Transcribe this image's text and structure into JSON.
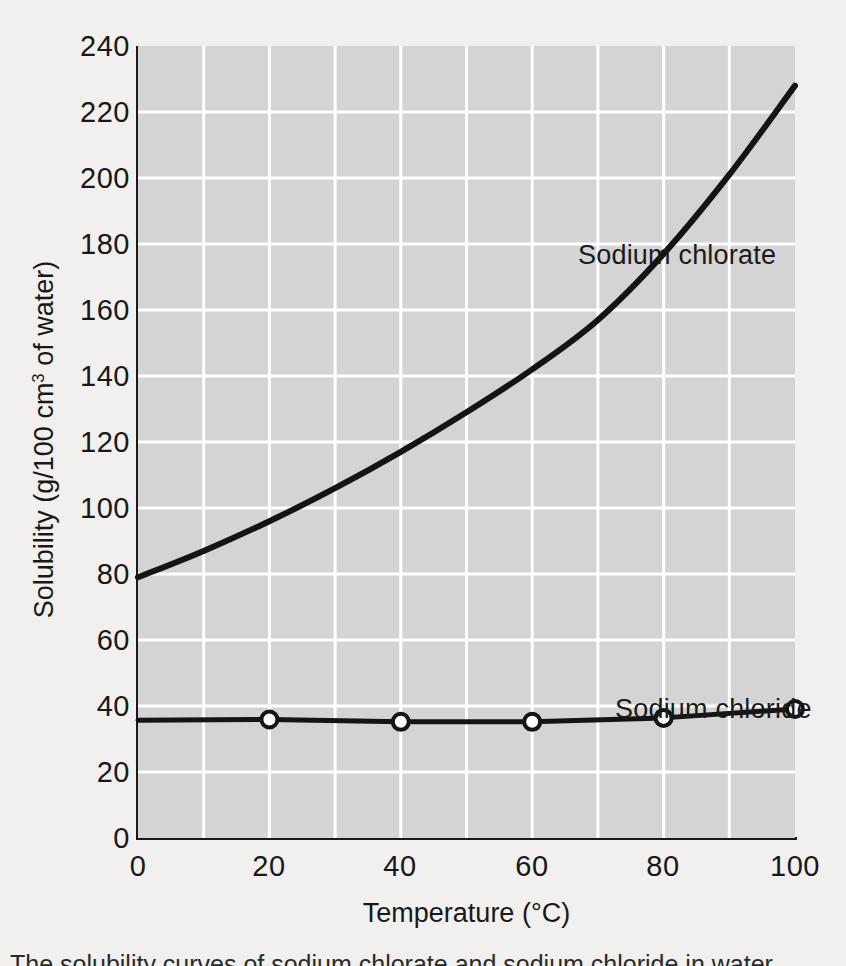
{
  "chart_data": {
    "type": "line",
    "title": "",
    "xlabel": "Temperature (°C)",
    "ylabel_text": "Solubility (g/100 cm",
    "ylabel_sup": "3",
    "ylabel_tail": " of water)",
    "xlim": [
      0,
      100
    ],
    "ylim": [
      0,
      240
    ],
    "grid": true,
    "grid_color": "#ffffff",
    "plot_background": "#d4d4d4",
    "page_background": "#f1f0ee",
    "line_color": "#141414",
    "legend_position": "in-plot-annotations",
    "xticks": [
      "0",
      "20",
      "40",
      "60",
      "80",
      "100"
    ],
    "xtick_values": [
      0,
      20,
      40,
      60,
      80,
      100
    ],
    "yticks": [
      "0",
      "20",
      "40",
      "60",
      "80",
      "100",
      "120",
      "140",
      "160",
      "180",
      "200",
      "220",
      "240"
    ],
    "ytick_values": [
      0,
      20,
      40,
      60,
      80,
      100,
      120,
      140,
      160,
      180,
      200,
      220,
      240
    ],
    "minor_grid_x_step": 10,
    "minor_grid_y_step": 20,
    "series": [
      {
        "name": "Sodium chlorate",
        "label": "Sodium chlorate",
        "markers": false,
        "x": [
          0,
          10,
          20,
          30,
          40,
          50,
          60,
          70,
          80,
          90,
          100
        ],
        "values": [
          79,
          87,
          96,
          106,
          117,
          129,
          142,
          157,
          177,
          201,
          228
        ]
      },
      {
        "name": "Sodium chloride",
        "label": "Sodium chloride",
        "markers": true,
        "marker_style": "open-circle",
        "x": [
          0,
          20,
          40,
          60,
          80,
          100
        ],
        "values": [
          35.7,
          35.9,
          35.2,
          35.2,
          36.4,
          39.1
        ]
      }
    ]
  },
  "annotations": {
    "chlorate_label": "Sodium chlorate",
    "chloride_label": "Sodium chloride"
  },
  "caption": {
    "text": "The solubility curves of sodium chlorate and sodium chloride in water"
  }
}
